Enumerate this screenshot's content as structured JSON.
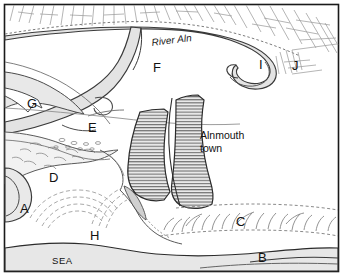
{
  "figure": {
    "name": "Alnmouth estuary sketch map",
    "border_color": "#111111",
    "background": "#ffffff"
  },
  "labels": {
    "river": "River Aln",
    "town": "Alnmouth",
    "town_line2": "town",
    "sea": "SEA",
    "key_a": "A",
    "key_b": "B",
    "key_c": "C",
    "key_d": "D",
    "key_e": "E",
    "key_f": "F",
    "key_g": "G",
    "key_h": "H",
    "key_i": "I",
    "key_j": "J"
  },
  "colors": {
    "ink": "#1a1a1a",
    "line": "#333333",
    "water_fill": "#e2e2e2",
    "sea_fill": "#e6e6e6",
    "town_fill": "#d9d9d9",
    "hill_hatch": "#9a9a9a",
    "dune_line": "#8a8a8a"
  },
  "features": [
    {
      "id": "A",
      "kind": "headland-bay"
    },
    {
      "id": "B",
      "kind": "sea-edge-south"
    },
    {
      "id": "C",
      "kind": "dune-ridge-south"
    },
    {
      "id": "D",
      "kind": "saltmarsh"
    },
    {
      "id": "E",
      "kind": "meander-scar"
    },
    {
      "id": "F",
      "kind": "river-channel-bend"
    },
    {
      "id": "G",
      "kind": "valley-side"
    },
    {
      "id": "H",
      "kind": "beach-dunes"
    },
    {
      "id": "I",
      "kind": "meander-loop"
    },
    {
      "id": "J",
      "kind": "valley-slope-east"
    }
  ]
}
